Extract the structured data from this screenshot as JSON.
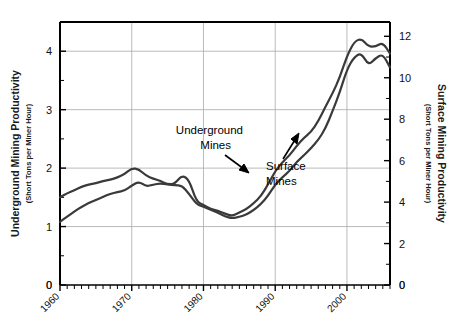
{
  "chart_data": {
    "type": "line",
    "title": "",
    "xlabel": "",
    "ylabel": "Underground Mining Productivity",
    "ylabel_sub": "(Short Tons per Miner Hour)",
    "y2label": "Surface Mining Productivity",
    "y2label_sub": "(Short Tons per Miner Hour)",
    "xlim": [
      1960,
      2006
    ],
    "ylim": [
      0,
      4.5
    ],
    "y2lim": [
      0,
      12.69
    ],
    "grid": true,
    "legend_position": "inline-annotations",
    "xticks": [
      "1960",
      "1970",
      "1980",
      "1990",
      "2000"
    ],
    "xtick_values": [
      1960,
      1970,
      1980,
      1990,
      2000
    ],
    "yticks": [
      "0",
      "1",
      "2",
      "3",
      "4"
    ],
    "ytick_values": [
      0,
      1,
      2,
      3,
      4
    ],
    "y2ticks": [
      "0",
      "2",
      "4",
      "6",
      "8",
      "10",
      "12"
    ],
    "y2tick_values": [
      0,
      2,
      4,
      6,
      8,
      10,
      12
    ],
    "x": [
      1960,
      1961,
      1962,
      1963,
      1964,
      1965,
      1966,
      1967,
      1968,
      1969,
      1970,
      1971,
      1972,
      1973,
      1974,
      1975,
      1976,
      1977,
      1978,
      1979,
      1980,
      1981,
      1982,
      1983,
      1984,
      1985,
      1986,
      1987,
      1988,
      1989,
      1990,
      1991,
      1992,
      1993,
      1994,
      1995,
      1996,
      1997,
      1998,
      1999,
      2000,
      2001,
      2002,
      2003,
      2004,
      2005,
      2006
    ],
    "series": [
      {
        "name": "Underground Mines",
        "axis": "left",
        "units": "Short Tons per Miner Hour",
        "values": [
          1.5,
          1.57,
          1.62,
          1.68,
          1.72,
          1.74,
          1.78,
          1.8,
          1.84,
          1.9,
          2.0,
          1.98,
          1.87,
          1.82,
          1.78,
          1.72,
          1.73,
          1.88,
          1.8,
          1.43,
          1.37,
          1.3,
          1.27,
          1.22,
          1.18,
          1.24,
          1.3,
          1.4,
          1.52,
          1.72,
          1.95,
          2.1,
          2.22,
          2.38,
          2.52,
          2.62,
          2.8,
          3.05,
          3.28,
          3.55,
          3.92,
          4.16,
          4.22,
          4.08,
          4.08,
          4.15,
          3.96
        ]
      },
      {
        "name": "Surface Mines",
        "axis": "right",
        "units": "Short Tons per Miner Hour",
        "values": [
          3.05,
          3.3,
          3.55,
          3.78,
          3.95,
          4.1,
          4.25,
          4.4,
          4.48,
          4.55,
          4.8,
          5.0,
          4.75,
          4.85,
          4.9,
          4.85,
          4.82,
          4.8,
          4.4,
          3.9,
          3.78,
          3.62,
          3.5,
          3.3,
          3.22,
          3.28,
          3.4,
          3.62,
          3.9,
          4.3,
          4.85,
          5.2,
          5.5,
          5.95,
          6.25,
          6.6,
          7.0,
          7.55,
          8.4,
          9.3,
          10.4,
          11.0,
          11.2,
          10.6,
          10.95,
          11.15,
          10.5
        ]
      }
    ],
    "annotations": [
      {
        "label_line1": "Underground",
        "label_line2": "Mines",
        "target_series": "Underground Mines"
      },
      {
        "label_line1": "Surface",
        "label_line2": "Mines",
        "target_series": "Surface Mines"
      }
    ],
    "colors": {
      "line": "#3a3a3a",
      "grid": "#a9a9a9",
      "axis": "#000000",
      "background": "#ffffff"
    }
  }
}
